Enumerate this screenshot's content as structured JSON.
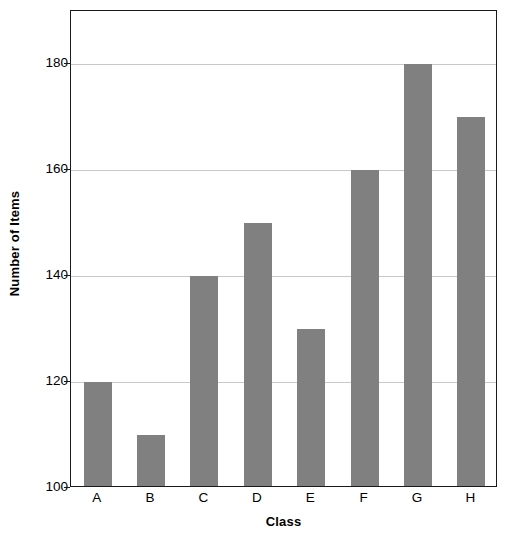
{
  "chart_data": {
    "type": "bar",
    "title": "",
    "subtitle": "",
    "xlabel": "Class",
    "ylabel": "Number of Items",
    "categories": [
      "A",
      "B",
      "C",
      "D",
      "E",
      "F",
      "G",
      "H"
    ],
    "values": [
      120,
      110,
      140,
      150,
      130,
      160,
      180,
      170
    ],
    "ylim": [
      100,
      190
    ],
    "yticks": [
      100,
      120,
      140,
      160,
      180
    ],
    "ytick_labels": [
      "100",
      "120",
      "140",
      "160",
      "180"
    ],
    "xtick_labels": [
      "A",
      "B",
      "C",
      "D",
      "E",
      "F",
      "G",
      "H"
    ],
    "grid": true,
    "grid_axis": "y",
    "legend": false,
    "legend_position": "none",
    "annotations": [],
    "bar_color": "#808080",
    "grid_color": "#c8c8c8",
    "axis_color": "#1a1a1a",
    "background_color": "#ffffff"
  }
}
